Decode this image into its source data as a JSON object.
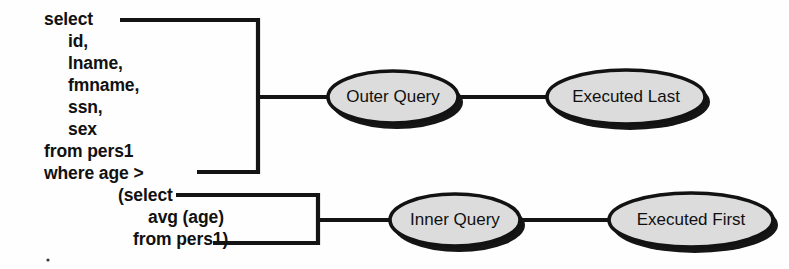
{
  "diagram": {
    "type": "sql-subquery-execution-order",
    "background_color": "#fefefe",
    "line_color": "#141414",
    "node_fill_color": "#dcdcdc",
    "node_stroke_color": "#121212",
    "node_shadow_color": "#151515",
    "text_color": "#111111"
  },
  "query": {
    "outer": {
      "lines": [
        "select",
        "id,",
        "lname,",
        "fmname,",
        "ssn,",
        "sex",
        "from pers1",
        "where age >"
      ]
    },
    "inner": {
      "lines": [
        "(select",
        "avg (age)",
        "from pers1)"
      ]
    }
  },
  "nodes": {
    "outer_query": "Outer Query",
    "executed_last": "Executed Last",
    "inner_query": "Inner Query",
    "executed_first": "Executed First"
  }
}
